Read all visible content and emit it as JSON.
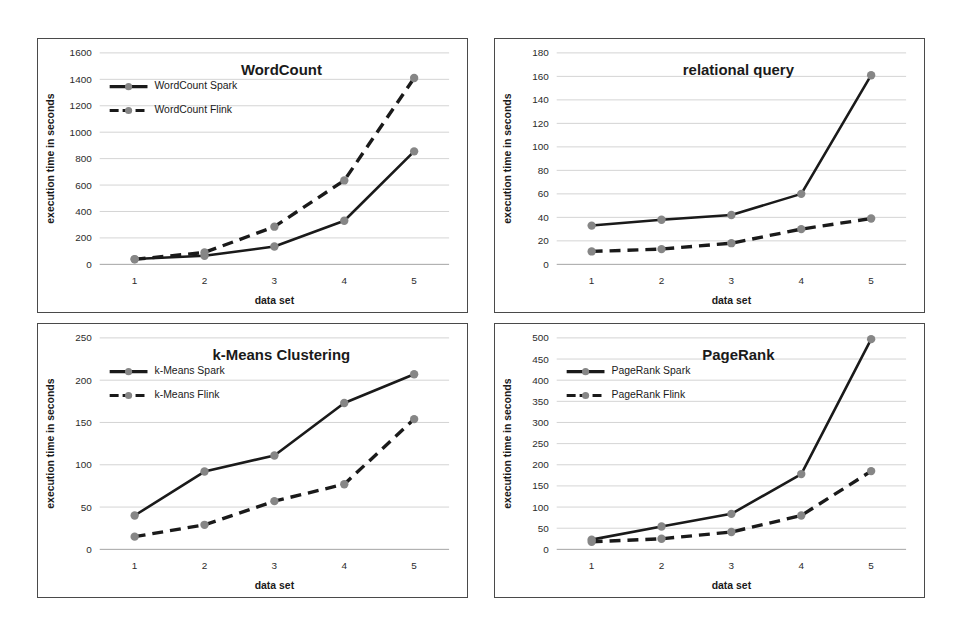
{
  "figure": {
    "panel_count": 4,
    "shared_xlabel": "data set",
    "shared_ylabel": "execution time in seconds",
    "marker_color": "#868686",
    "line_color": "#1a1a1a",
    "border_color": "#4a4a4a",
    "gridline_color": "#c9c9c9",
    "background": "#ffffff"
  },
  "chart_data": [
    {
      "id": "wordcount",
      "type": "line",
      "title": "WordCount",
      "xlabel": "data set",
      "ylabel": "execution time in seconds",
      "categories": [
        "1",
        "2",
        "3",
        "4",
        "5"
      ],
      "x": [
        1,
        2,
        3,
        4,
        5
      ],
      "ylim": [
        0,
        1600
      ],
      "yticks": [
        0,
        200,
        400,
        600,
        800,
        1000,
        1200,
        1400,
        1600
      ],
      "grid": true,
      "legend": true,
      "legend_position": "upper-left",
      "series": [
        {
          "name": "WordCount Spark",
          "style": "solid",
          "values": [
            40,
            65,
            135,
            330,
            855
          ]
        },
        {
          "name": "WordCount Flink",
          "style": "dashed",
          "values": [
            38,
            90,
            285,
            635,
            1410
          ]
        }
      ]
    },
    {
      "id": "relational-query",
      "type": "line",
      "title": "relational query",
      "xlabel": "data set",
      "ylabel": "execution time in seconds",
      "categories": [
        "1",
        "2",
        "3",
        "4",
        "5"
      ],
      "x": [
        1,
        2,
        3,
        4,
        5
      ],
      "ylim": [
        0,
        180
      ],
      "yticks": [
        0,
        20,
        40,
        60,
        80,
        100,
        120,
        140,
        160,
        180
      ],
      "grid": true,
      "legend": false,
      "legend_position": "none",
      "series": [
        {
          "name": "relational query Spark",
          "style": "solid",
          "values": [
            33,
            38,
            42,
            60,
            161
          ]
        },
        {
          "name": "relational query Flink",
          "style": "dashed",
          "values": [
            11,
            13,
            18,
            30,
            39
          ]
        }
      ]
    },
    {
      "id": "k-means-clustering",
      "type": "line",
      "title": "k-Means Clustering",
      "xlabel": "data set",
      "ylabel": "execution time in seconds",
      "categories": [
        "1",
        "2",
        "3",
        "4",
        "5"
      ],
      "x": [
        1,
        2,
        3,
        4,
        5
      ],
      "ylim": [
        0,
        250
      ],
      "yticks": [
        0,
        50,
        100,
        150,
        200,
        250
      ],
      "grid": true,
      "legend": true,
      "legend_position": "upper-left",
      "series": [
        {
          "name": "k-Means Spark",
          "style": "solid",
          "values": [
            40,
            92,
            111,
            173,
            207
          ]
        },
        {
          "name": "k-Means Flink",
          "style": "dashed",
          "values": [
            15,
            29,
            57,
            77,
            154
          ]
        }
      ]
    },
    {
      "id": "pagerank",
      "type": "line",
      "title": "PageRank",
      "xlabel": "data set",
      "ylabel": "execution time in seconds",
      "categories": [
        "1",
        "2",
        "3",
        "4",
        "5"
      ],
      "x": [
        1,
        2,
        3,
        4,
        5
      ],
      "ylim": [
        0,
        500
      ],
      "yticks": [
        0,
        50,
        100,
        150,
        200,
        250,
        300,
        350,
        400,
        450,
        500
      ],
      "grid": true,
      "legend": true,
      "legend_position": "upper-left",
      "series": [
        {
          "name": "PageRank Spark",
          "style": "solid",
          "values": [
            23,
            54,
            84,
            178,
            497
          ]
        },
        {
          "name": "PageRank Flink",
          "style": "dashed",
          "values": [
            18,
            25,
            41,
            80,
            185
          ]
        }
      ]
    }
  ]
}
